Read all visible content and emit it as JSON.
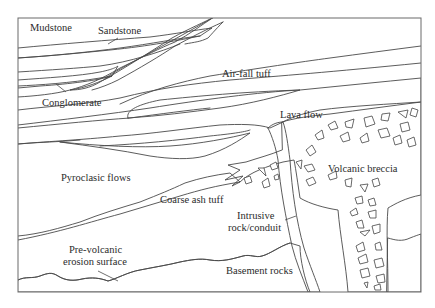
{
  "figure": {
    "colors": {
      "background": "#ffffff",
      "light_fill": "#ececec",
      "medium_fill": "#d4d4d4",
      "breccia_fill": "#bdbdbd",
      "line": "#4a4a4a",
      "clast": "#ffffff"
    },
    "labels": {
      "mudstone": "Mudstone",
      "sandstone": "Sandstone",
      "conglomerate": "Conglomerate",
      "air_fall_tuff": "Air-fall tuff",
      "lava_flow": "Lava flow",
      "pyroclastic_flows": "Pyroclasic flows",
      "coarse_ash_tuff": "Coarse ash tuff",
      "volcanic_breccia": "Volcanic breccia",
      "intrusive_line1": "Intrusive",
      "intrusive_line2": "rock/conduit",
      "pre_volcanic_line1": "Pre-volcanic",
      "pre_volcanic_line2": "erosion surface",
      "basement_rocks": "Basement rocks"
    }
  }
}
